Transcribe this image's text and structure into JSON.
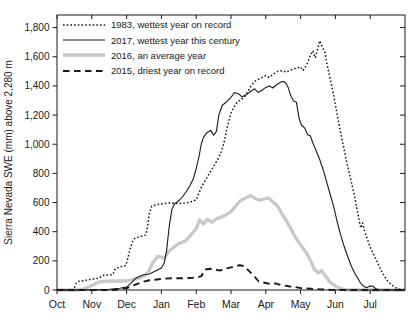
{
  "chart_data": {
    "type": "line",
    "title": "",
    "xlabel": "",
    "ylabel": "Sierra Nevada SWE (mm) above 2,280 m",
    "x_unit": "months since Oct 1 (0=Oct 1 ... 10=Aug 1)",
    "xlim": [
      0,
      10
    ],
    "ylim": [
      0,
      1886
    ],
    "grid": false,
    "legend_position": "top-left",
    "x_tick_positions": [
      0,
      1,
      2,
      3,
      4,
      5,
      6,
      7,
      8,
      9
    ],
    "x_tick_labels": [
      "Oct",
      "Nov",
      "Dec",
      "Jan",
      "Feb",
      "Mar",
      "Apr",
      "May",
      "Jun",
      "Jul"
    ],
    "y_tick_values": [
      0,
      200,
      400,
      600,
      800,
      1000,
      1200,
      1400,
      1600,
      1800
    ],
    "y_tick_labels": [
      "0",
      "200",
      "400",
      "600",
      "800",
      "1,000",
      "1,200",
      "1,400",
      "1,600",
      "1,800"
    ],
    "axis_color": "#1a1a1a",
    "background_color": "#ffffff",
    "series": [
      {
        "label": "1983, wettest year on record",
        "style": "dotted",
        "color": "#1a1a1a",
        "width": 1.5,
        "dash": "1.6 2.1",
        "points": [
          [
            0,
            0
          ],
          [
            0.45,
            0
          ],
          [
            0.5,
            15
          ],
          [
            0.55,
            45
          ],
          [
            0.62,
            60
          ],
          [
            0.8,
            65
          ],
          [
            1.0,
            75
          ],
          [
            1.2,
            80
          ],
          [
            1.32,
            100
          ],
          [
            1.6,
            105
          ],
          [
            1.68,
            148
          ],
          [
            1.8,
            158
          ],
          [
            1.98,
            168
          ],
          [
            2.05,
            230
          ],
          [
            2.12,
            300
          ],
          [
            2.2,
            350
          ],
          [
            2.32,
            362
          ],
          [
            2.45,
            370
          ],
          [
            2.55,
            378
          ],
          [
            2.6,
            430
          ],
          [
            2.65,
            520
          ],
          [
            2.72,
            575
          ],
          [
            2.85,
            585
          ],
          [
            3.0,
            590
          ],
          [
            3.2,
            598
          ],
          [
            3.5,
            593
          ],
          [
            3.8,
            600
          ],
          [
            4.0,
            618
          ],
          [
            4.07,
            660
          ],
          [
            4.15,
            705
          ],
          [
            4.25,
            748
          ],
          [
            4.35,
            788
          ],
          [
            4.45,
            828
          ],
          [
            4.55,
            868
          ],
          [
            4.65,
            908
          ],
          [
            4.72,
            950
          ],
          [
            4.8,
            1010
          ],
          [
            4.88,
            1105
          ],
          [
            4.95,
            1170
          ],
          [
            5.0,
            1215
          ],
          [
            5.08,
            1252
          ],
          [
            5.18,
            1290
          ],
          [
            5.28,
            1305
          ],
          [
            5.38,
            1322
          ],
          [
            5.48,
            1358
          ],
          [
            5.58,
            1402
          ],
          [
            5.68,
            1430
          ],
          [
            5.78,
            1445
          ],
          [
            5.88,
            1455
          ],
          [
            6.0,
            1470
          ],
          [
            6.1,
            1458
          ],
          [
            6.22,
            1482
          ],
          [
            6.35,
            1500
          ],
          [
            6.48,
            1505
          ],
          [
            6.58,
            1494
          ],
          [
            6.72,
            1510
          ],
          [
            6.85,
            1520
          ],
          [
            7.0,
            1530
          ],
          [
            7.07,
            1505
          ],
          [
            7.18,
            1548
          ],
          [
            7.28,
            1608
          ],
          [
            7.35,
            1640
          ],
          [
            7.42,
            1592
          ],
          [
            7.5,
            1660
          ],
          [
            7.55,
            1710
          ],
          [
            7.62,
            1668
          ],
          [
            7.7,
            1630
          ],
          [
            7.75,
            1560
          ],
          [
            7.85,
            1448
          ],
          [
            7.95,
            1335
          ],
          [
            8.05,
            1205
          ],
          [
            8.15,
            1080
          ],
          [
            8.25,
            965
          ],
          [
            8.35,
            850
          ],
          [
            8.45,
            748
          ],
          [
            8.55,
            645
          ],
          [
            8.62,
            555
          ],
          [
            8.68,
            480
          ],
          [
            8.73,
            425
          ],
          [
            8.78,
            460
          ],
          [
            8.85,
            395
          ],
          [
            9.0,
            295
          ],
          [
            9.1,
            242
          ],
          [
            9.2,
            192
          ],
          [
            9.3,
            142
          ],
          [
            9.4,
            98
          ],
          [
            9.5,
            62
          ],
          [
            9.6,
            38
          ],
          [
            9.7,
            20
          ],
          [
            9.8,
            8
          ],
          [
            9.9,
            2
          ],
          [
            10,
            0
          ]
        ]
      },
      {
        "label": "2017, wettest year this century",
        "style": "solid",
        "color": "#1a1a1a",
        "width": 1.1,
        "dash": "",
        "points": [
          [
            0,
            0
          ],
          [
            1.0,
            0
          ],
          [
            1.5,
            5
          ],
          [
            1.8,
            12
          ],
          [
            2.0,
            20
          ],
          [
            2.12,
            45
          ],
          [
            2.25,
            78
          ],
          [
            2.38,
            95
          ],
          [
            2.5,
            105
          ],
          [
            2.65,
            110
          ],
          [
            2.82,
            128
          ],
          [
            3.0,
            150
          ],
          [
            3.08,
            185
          ],
          [
            3.15,
            270
          ],
          [
            3.22,
            430
          ],
          [
            3.3,
            550
          ],
          [
            3.38,
            592
          ],
          [
            3.5,
            612
          ],
          [
            3.6,
            638
          ],
          [
            3.72,
            678
          ],
          [
            3.82,
            715
          ],
          [
            3.92,
            765
          ],
          [
            4.0,
            832
          ],
          [
            4.08,
            915
          ],
          [
            4.15,
            1005
          ],
          [
            4.22,
            1052
          ],
          [
            4.32,
            1082
          ],
          [
            4.42,
            1095
          ],
          [
            4.5,
            1062
          ],
          [
            4.58,
            1088
          ],
          [
            4.65,
            1200
          ],
          [
            4.75,
            1268
          ],
          [
            4.88,
            1292
          ],
          [
            5.0,
            1322
          ],
          [
            5.1,
            1355
          ],
          [
            5.22,
            1345
          ],
          [
            5.32,
            1325
          ],
          [
            5.45,
            1342
          ],
          [
            5.58,
            1365
          ],
          [
            5.68,
            1380
          ],
          [
            5.78,
            1355
          ],
          [
            5.9,
            1372
          ],
          [
            6.0,
            1390
          ],
          [
            6.1,
            1400
          ],
          [
            6.2,
            1386
          ],
          [
            6.32,
            1410
          ],
          [
            6.45,
            1428
          ],
          [
            6.52,
            1430
          ],
          [
            6.58,
            1418
          ],
          [
            6.65,
            1385
          ],
          [
            6.72,
            1330
          ],
          [
            6.8,
            1296
          ],
          [
            6.88,
            1288
          ],
          [
            6.95,
            1185
          ],
          [
            7.02,
            1132
          ],
          [
            7.12,
            1110
          ],
          [
            7.2,
            1065
          ],
          [
            7.28,
            1058
          ],
          [
            7.35,
            1010
          ],
          [
            7.45,
            952
          ],
          [
            7.55,
            895
          ],
          [
            7.65,
            825
          ],
          [
            7.75,
            740
          ],
          [
            7.85,
            655
          ],
          [
            7.95,
            572
          ],
          [
            8.05,
            470
          ],
          [
            8.15,
            378
          ],
          [
            8.25,
            300
          ],
          [
            8.35,
            232
          ],
          [
            8.45,
            168
          ],
          [
            8.55,
            118
          ],
          [
            8.65,
            78
          ],
          [
            8.72,
            48
          ],
          [
            8.8,
            28
          ],
          [
            8.9,
            16
          ],
          [
            9.0,
            28
          ],
          [
            9.08,
            26
          ],
          [
            9.15,
            10
          ],
          [
            9.25,
            2
          ],
          [
            9.4,
            0
          ],
          [
            10,
            0
          ]
        ]
      },
      {
        "label": "2016, an average year",
        "style": "solid",
        "color": "#c9c9c9",
        "width": 3.3,
        "dash": "",
        "points": [
          [
            0,
            0
          ],
          [
            0.6,
            0
          ],
          [
            0.8,
            10
          ],
          [
            1.0,
            30
          ],
          [
            1.2,
            55
          ],
          [
            1.5,
            62
          ],
          [
            2.0,
            62
          ],
          [
            2.2,
            72
          ],
          [
            2.4,
            85
          ],
          [
            2.55,
            105
          ],
          [
            2.65,
            135
          ],
          [
            2.75,
            185
          ],
          [
            2.9,
            232
          ],
          [
            3.0,
            225
          ],
          [
            3.08,
            216
          ],
          [
            3.2,
            262
          ],
          [
            3.35,
            292
          ],
          [
            3.5,
            318
          ],
          [
            3.7,
            338
          ],
          [
            3.85,
            378
          ],
          [
            4.0,
            420
          ],
          [
            4.1,
            482
          ],
          [
            4.2,
            452
          ],
          [
            4.32,
            486
          ],
          [
            4.45,
            466
          ],
          [
            4.6,
            492
          ],
          [
            4.75,
            502
          ],
          [
            5.0,
            538
          ],
          [
            5.15,
            582
          ],
          [
            5.3,
            618
          ],
          [
            5.45,
            635
          ],
          [
            5.57,
            648
          ],
          [
            5.7,
            626
          ],
          [
            5.82,
            616
          ],
          [
            6.0,
            628
          ],
          [
            6.08,
            632
          ],
          [
            6.2,
            606
          ],
          [
            6.32,
            582
          ],
          [
            6.45,
            528
          ],
          [
            6.57,
            482
          ],
          [
            6.7,
            430
          ],
          [
            6.82,
            375
          ],
          [
            6.95,
            325
          ],
          [
            7.05,
            292
          ],
          [
            7.15,
            262
          ],
          [
            7.28,
            205
          ],
          [
            7.4,
            140
          ],
          [
            7.5,
            118
          ],
          [
            7.6,
            132
          ],
          [
            7.72,
            95
          ],
          [
            7.82,
            62
          ],
          [
            7.92,
            40
          ],
          [
            8.02,
            25
          ],
          [
            8.15,
            10
          ],
          [
            8.3,
            3
          ],
          [
            8.45,
            0
          ],
          [
            10,
            0
          ]
        ]
      },
      {
        "label": "2015, driest year on record",
        "style": "dashed",
        "color": "#1a1a1a",
        "width": 1.9,
        "dash": "6.5 4.5",
        "points": [
          [
            0,
            0
          ],
          [
            1.6,
            0
          ],
          [
            1.8,
            5
          ],
          [
            2.0,
            12
          ],
          [
            2.2,
            32
          ],
          [
            2.45,
            55
          ],
          [
            2.62,
            65
          ],
          [
            2.8,
            70
          ],
          [
            3.0,
            76
          ],
          [
            3.3,
            80
          ],
          [
            3.6,
            80
          ],
          [
            3.9,
            84
          ],
          [
            4.05,
            88
          ],
          [
            4.15,
            95
          ],
          [
            4.25,
            140
          ],
          [
            4.4,
            146
          ],
          [
            4.55,
            140
          ],
          [
            4.68,
            133
          ],
          [
            4.82,
            146
          ],
          [
            5.0,
            155
          ],
          [
            5.15,
            165
          ],
          [
            5.25,
            170
          ],
          [
            5.38,
            164
          ],
          [
            5.48,
            140
          ],
          [
            5.58,
            116
          ],
          [
            5.7,
            85
          ],
          [
            5.8,
            58
          ],
          [
            6.0,
            48
          ],
          [
            6.15,
            40
          ],
          [
            6.28,
            46
          ],
          [
            6.42,
            34
          ],
          [
            6.55,
            30
          ],
          [
            6.7,
            24
          ],
          [
            6.85,
            20
          ],
          [
            7.0,
            13
          ],
          [
            7.3,
            8
          ],
          [
            7.6,
            4
          ],
          [
            7.9,
            1
          ],
          [
            8.1,
            0
          ],
          [
            10,
            0
          ]
        ]
      }
    ]
  }
}
